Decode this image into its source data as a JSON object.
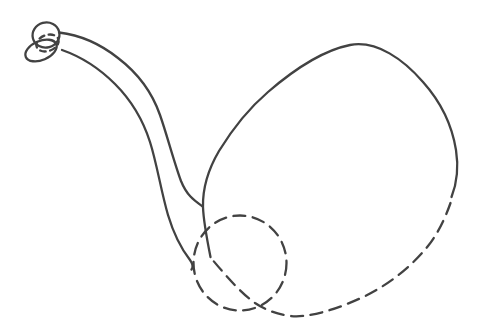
{
  "canvas": {
    "width": 479,
    "height": 330,
    "viewBox": "0 0 479 330",
    "background": "#ffffff"
  },
  "drawing": {
    "subject": "long-necked-figure-line-sketch",
    "stroke_color": "#424242",
    "stroke_width": 2.3,
    "dash_long": "12 7.5",
    "dash_short": "5.5 4.5",
    "shapes": [
      {
        "name": "head-top-circle",
        "type": "ellipse",
        "cx": 46,
        "cy": 35,
        "rx": 13.5,
        "ry": 12.5,
        "rotate": -15,
        "line": "solid"
      },
      {
        "name": "head-snout-ellipse",
        "type": "ellipse",
        "cx": 41,
        "cy": 50.5,
        "rx": 16.5,
        "ry": 9.5,
        "rotate": -23,
        "line": "solid"
      },
      {
        "name": "head-overlap-dashed-ellipse",
        "type": "ellipse",
        "cx": 47.5,
        "cy": 43,
        "rx": 11.5,
        "ry": 8,
        "rotate": -20,
        "line": "dashed-short"
      },
      {
        "name": "neck-upper-line",
        "type": "path",
        "d": "M 59 32.5 C 80 35 101 44.5 118 58 C 139 74 152 92 160 115 C 167 135 174 162 181 181 C 187 196 195 201 202 206",
        "line": "solid"
      },
      {
        "name": "neck-lower-line",
        "type": "path",
        "d": "M 62 50 C 82 57 100 69 115 84 C 132 101 143 120 150 142 C 157 164 161 191 168 215 C 174 235 183 251 190 260 C 193 264 193.5 267 191.5 269.5",
        "line": "solid"
      },
      {
        "name": "body-outline-solid",
        "type": "path",
        "d": "M 210.5 257 C 207.5 242 203.5 222 203 207 C 202.5 186 209 168 219 151 C 230 133 247 110 268 92 C 290 73 320 51 350 45 C 377 40 404 60 423 82 C 440 101 452 125 456 150 C 459 169 457 183 451.5 197",
        "line": "solid"
      },
      {
        "name": "body-outline-dashed-arc",
        "type": "path",
        "d": "M 450.5 203 C 447 213 440 231 428 246 C 412 266 389 285 361 298 C 337 309 309 318 291 316 C 275 314 264 309 255 303 C 241 293 227 277 213.5 261",
        "line": "dashed"
      },
      {
        "name": "overlap-dashed-circle",
        "type": "ellipse",
        "cx": 240,
        "cy": 263,
        "rx": 46.5,
        "ry": 47.5,
        "rotate": 0,
        "line": "dashed"
      }
    ]
  }
}
